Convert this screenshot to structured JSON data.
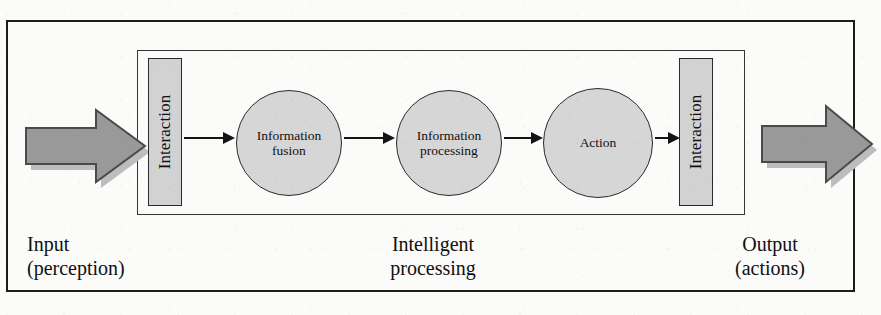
{
  "diagram": {
    "outer_frame": {
      "label": "outer-boundary"
    },
    "inner_frame": {
      "label": "intelligent-processing-boundary"
    },
    "interaction_left": {
      "label": "Interaction"
    },
    "interaction_right": {
      "label": "Interaction"
    },
    "nodes": [
      {
        "id": "fusion",
        "line1": "Information",
        "line2": "fusion"
      },
      {
        "id": "processing",
        "line1": "Information",
        "line2": "processing"
      },
      {
        "id": "action",
        "line1": "Action",
        "line2": ""
      }
    ],
    "captions": {
      "input": {
        "line1": "Input",
        "line2": "(perception)"
      },
      "middle": {
        "line1": "Intelligent",
        "line2": "processing"
      },
      "output": {
        "line1": "Output",
        "line2": "(actions)"
      }
    },
    "arrows": {
      "input_block": "input-block-arrow",
      "output_block": "output-block-arrow",
      "flow": [
        "interaction-to-fusion",
        "fusion-to-processing",
        "processing-to-action",
        "action-to-interaction"
      ]
    },
    "colors": {
      "page_background": "#fbfbf9",
      "frame_stroke": "#1c1c1c",
      "node_fill": "#d6d6d6",
      "interaction_fill": "#d2d2d2",
      "block_arrow_fill": "#999999",
      "block_arrow_stroke": "#4a4a4a",
      "shadow": "#bdbdbd",
      "text": "#101010"
    }
  }
}
